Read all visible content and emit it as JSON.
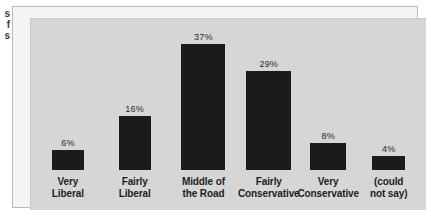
{
  "caption_fragment": {
    "line1": "s",
    "line2": "f",
    "line3": "s"
  },
  "chart_data": {
    "type": "bar",
    "title": "",
    "subtitle": "",
    "xlabel": "",
    "ylabel": "",
    "ylim": [
      0,
      40
    ],
    "grid": false,
    "legend": "none",
    "orientation": "vertical",
    "bar_color": "#1b1b1b",
    "plot_background": "#d6d6d6",
    "frame_background": "#f4f4f4",
    "value_suffix": "%",
    "categories": [
      "Very Liberal",
      "Fairly Liberal",
      "Middle of the Road",
      "Fairly Conservative",
      "Very Conservative",
      "(could not say)"
    ],
    "values": [
      6,
      16,
      37,
      29,
      8,
      4
    ],
    "bars": [
      {
        "value_label": "6%",
        "value": 6,
        "label_line1": "Very",
        "label_line2": "Liberal",
        "left_pct": 5.3,
        "width_pct": 8.1
      },
      {
        "value_label": "16%",
        "value": 16,
        "label_line1": "Fairly",
        "label_line2": "Liberal",
        "left_pct": 22.2,
        "width_pct": 8.1
      },
      {
        "value_label": "37%",
        "value": 37,
        "label_line1": "Middle of",
        "label_line2": "the Road",
        "left_pct": 38.1,
        "width_pct": 11.1
      },
      {
        "value_label": "29%",
        "value": 29,
        "label_line1": "Fairly",
        "label_line2": "Conservative",
        "left_pct": 54.5,
        "width_pct": 11.4
      },
      {
        "value_label": "8%",
        "value": 8,
        "label_line1": "Very",
        "label_line2": "Conservative",
        "left_pct": 70.7,
        "width_pct": 9.1
      },
      {
        "value_label": "4%",
        "value": 4,
        "label_line1": "(could",
        "label_line2": "not say)",
        "left_pct": 86.4,
        "width_pct": 8.3
      }
    ]
  }
}
